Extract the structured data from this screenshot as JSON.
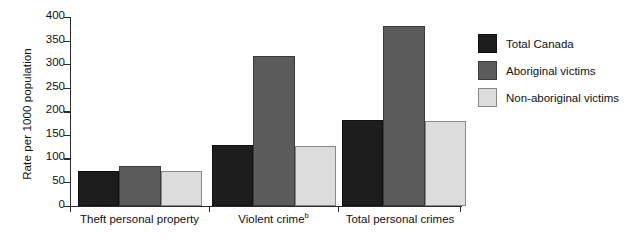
{
  "chart_data": {
    "type": "bar",
    "title": "",
    "subtitle": "",
    "xlabel": "",
    "ylabel": "Rate per 1000 population",
    "ylim": [
      0,
      400
    ],
    "ytick_values": [
      0,
      50,
      100,
      150,
      200,
      250,
      300,
      350,
      400
    ],
    "ytick_labels": [
      "0",
      "50",
      "100",
      "150",
      "200",
      "250",
      "300",
      "350",
      "400"
    ],
    "grid": false,
    "legend_position": "right",
    "categories": [
      "Theft personal property",
      "Violent crime",
      "Total personal crimes"
    ],
    "category_footnotes": [
      "",
      "b",
      ""
    ],
    "series": [
      {
        "name": "Total Canada",
        "color": "#1d1d1d",
        "values": [
          74,
          128,
          181
        ]
      },
      {
        "name": "Aboriginal victims",
        "color": "#5b5b5b",
        "values": [
          85,
          318,
          382
        ]
      },
      {
        "name": "Non-aboriginal victims",
        "color": "#dcdcdc",
        "values": [
          73,
          127,
          180
        ]
      }
    ]
  },
  "legend": {
    "items": [
      {
        "label": "Total Canada"
      },
      {
        "label": "Aboriginal victims"
      },
      {
        "label": "Non-aboriginal victims"
      }
    ]
  },
  "axes": {
    "y_title": "Rate per 1000 population"
  }
}
